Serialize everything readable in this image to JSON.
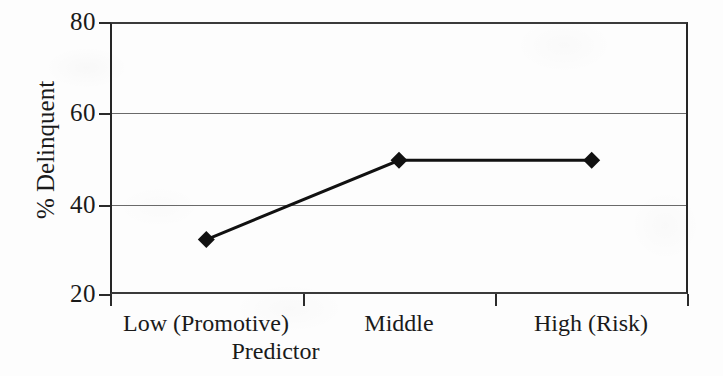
{
  "chart_data": {
    "type": "line",
    "title": "",
    "subtitle": "",
    "xlabel": "Predictor",
    "ylabel": "% Delinquent",
    "categories": [
      "Low (Promotive)",
      "Middle",
      "High (Risk)"
    ],
    "series": [
      {
        "name": "% Delinquent",
        "values": [
          32,
          49.5,
          49.5
        ],
        "marker": "diamond",
        "marker_color": "#111111",
        "line_color": "#111111",
        "line_width": 3
      }
    ],
    "ylim": [
      20,
      80
    ],
    "yticks": [
      20,
      40,
      60,
      80
    ],
    "ytick_labels": [
      "20",
      "40",
      "60",
      "80"
    ],
    "grid": true,
    "grid_axis": "y",
    "legend": false,
    "legend_position": "none",
    "annotations": []
  },
  "axes": {
    "y_title": "% Delinquent",
    "x_title": "Predictor",
    "y_tick_labels": [
      "80",
      "60",
      "40",
      "20"
    ],
    "x_tick_labels": [
      "Low (Promotive)",
      "Middle",
      "High (Risk)"
    ]
  },
  "colors": {
    "background": "#fdfdfd",
    "ink": "#1a1a1a",
    "gridline": "#6a6a6a",
    "frame": "#2b2b2b",
    "series": "#111111"
  }
}
